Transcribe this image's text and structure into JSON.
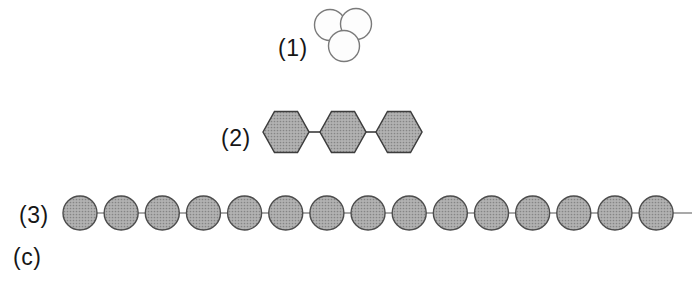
{
  "figure": {
    "caption_label": "(c)",
    "colors": {
      "background": "#ffffff",
      "label_color": "#161616",
      "halftone_base": "#b2b2b2",
      "halftone_dot": "#858585",
      "sphere_fill": "#fdfdfd",
      "sphere_shade": "#e9e9e9",
      "sphere_stroke": "#7a7a7a",
      "hex_stroke": "#3d3d3d",
      "connector": "#3d3d3d",
      "bead_stroke": "#4d4d4d",
      "chain_line": "#8c8c8c"
    },
    "groups": [
      {
        "label": "(1)",
        "type": "sphere-cluster",
        "sphere_count": 3,
        "spheres": [
          {
            "cx": 330,
            "cy": 25,
            "r": 15.5
          },
          {
            "cx": 356,
            "cy": 24,
            "r": 15.5
          },
          {
            "cx": 344,
            "cy": 46,
            "r": 15.5
          }
        ]
      },
      {
        "label": "(2)",
        "type": "hexagon-chain",
        "hexagon_count": 3,
        "hex_rx": 23,
        "hex_ry": 20.5,
        "hexagons": [
          {
            "cx": 286,
            "cy": 132
          },
          {
            "cx": 343,
            "cy": 132
          },
          {
            "cx": 399,
            "cy": 132
          }
        ]
      },
      {
        "label": "(3)",
        "type": "bead-chain",
        "bead_count": 15,
        "bead_r": 17,
        "first_cx": 80,
        "spacing": 41.15,
        "chain_y": 213,
        "line_x1": 80,
        "line_x2": 692
      }
    ]
  }
}
